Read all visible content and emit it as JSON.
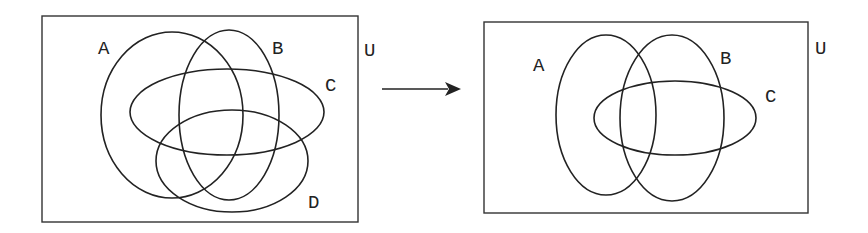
{
  "left_diagram": {
    "universe_label": "U",
    "sets": [
      {
        "label": "A"
      },
      {
        "label": "B"
      },
      {
        "label": "C"
      },
      {
        "label": "D"
      }
    ]
  },
  "right_diagram": {
    "universe_label": "U",
    "sets": [
      {
        "label": "A"
      },
      {
        "label": "B"
      },
      {
        "label": "C"
      }
    ]
  },
  "arrow": {
    "direction": "right"
  },
  "colors": {
    "stroke": "#222222",
    "background": "#ffffff"
  }
}
